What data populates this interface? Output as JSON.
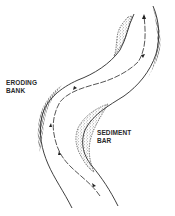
{
  "diagram": {
    "type": "meandering river channel",
    "labels": {
      "eroding_bank": {
        "line1": "ERODING",
        "line2": "BANK"
      },
      "sediment_bar": {
        "line1": "SEDIMENT",
        "line2": "BAR"
      }
    },
    "colors": {
      "ink": "#2a2a2a",
      "background": "#ffffff"
    },
    "elements": [
      "left channel bank",
      "right channel bank",
      "flow line with arrows",
      "eroding bank hatching (upper right outer bend)",
      "eroding bank hatching (left outer bend)",
      "sediment bar stipple (upper left inner bend)",
      "sediment bar stipple (lower right inner bend)"
    ]
  }
}
